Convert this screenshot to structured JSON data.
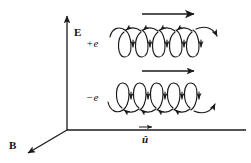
{
  "figure": {
    "background_color": "#ffffff",
    "stroke_color": "#1a1a1a",
    "width": 251,
    "height": 163
  },
  "axes": {
    "origin": {
      "x": 67,
      "y": 130
    },
    "items": [
      {
        "name": "E",
        "label": "E",
        "description": "vertical electric field axis pointing up",
        "label_x": 74,
        "label_y": 27,
        "tip": {
          "x": 67,
          "y": 14
        },
        "tail": {
          "x": 67,
          "y": 130
        }
      },
      {
        "name": "B",
        "label": "B",
        "description": "magnetic field axis pointing down-left out of page",
        "label_x": 9,
        "label_y": 140,
        "tip": {
          "x": 26,
          "y": 155
        },
        "tail": {
          "x": 67,
          "y": 130
        }
      },
      {
        "name": "u",
        "label": "û",
        "description": "propagation direction unit vector pointing right",
        "label_x": 142,
        "label_y": 134,
        "tip": {
          "x": 246,
          "y": 130
        },
        "tail": {
          "x": 67,
          "y": 130
        }
      }
    ]
  },
  "traces": [
    {
      "id": "positive",
      "charge_label": "+e",
      "sign": "+",
      "symbol": "e",
      "label_x": 86,
      "label_y": 38,
      "description": "helical path of a positive charge; loops hang below the guiding line",
      "loops": 5,
      "loop_width": 18,
      "loop_height": 30,
      "direction_arrow": {
        "name": "drift-arrow-positive",
        "x1": 142,
        "y1": 14,
        "x2": 196,
        "y2": 14,
        "direction": "right"
      }
    },
    {
      "id": "negative",
      "charge_label": "−e",
      "sign": "−",
      "symbol": "e",
      "label_x": 86,
      "label_y": 92,
      "description": "helical path of a negative charge; loops rise above the guiding line",
      "loops": 5,
      "loop_width": 18,
      "loop_height": 30,
      "direction_arrow": {
        "name": "drift-arrow-negative",
        "x1": 142,
        "y1": 71,
        "x2": 196,
        "y2": 71,
        "direction": "right"
      }
    }
  ]
}
